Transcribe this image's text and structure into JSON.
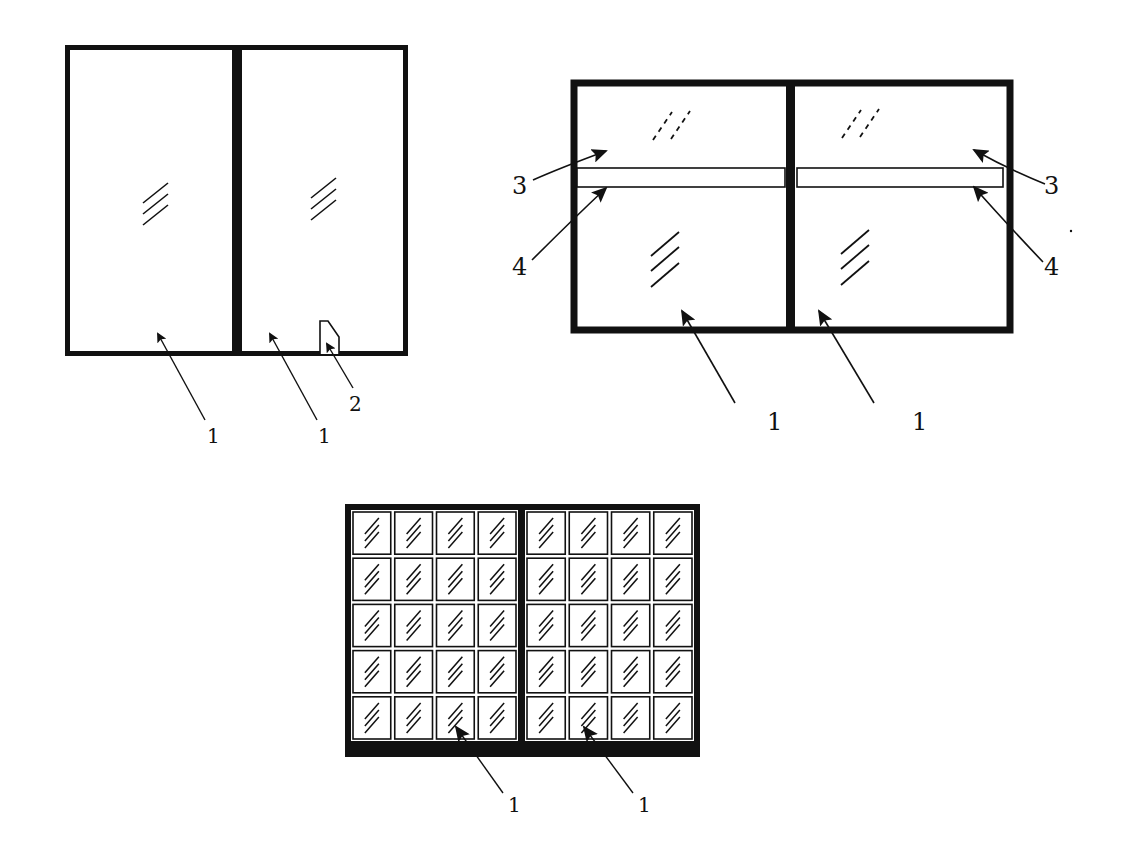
{
  "figures": [
    {
      "id": "figure-a",
      "description": "two-pane window with handle",
      "labels": [
        {
          "text": "1",
          "x": 212,
          "y": 443
        },
        {
          "text": "1",
          "x": 323,
          "y": 443
        },
        {
          "text": "2",
          "x": 355,
          "y": 411
        }
      ]
    },
    {
      "id": "figure-b",
      "description": "two-pane window with transom strips",
      "labels": [
        {
          "text": "3",
          "x": 521,
          "y": 194
        },
        {
          "text": "4",
          "x": 521,
          "y": 275
        },
        {
          "text": "3",
          "x": 1052,
          "y": 194
        },
        {
          "text": "4",
          "x": 1052,
          "y": 275
        },
        {
          "text": "1",
          "x": 775,
          "y": 430
        },
        {
          "text": "1",
          "x": 920,
          "y": 430
        }
      ]
    },
    {
      "id": "figure-c",
      "description": "two-section window with 8x5 grid of small panes",
      "grid": {
        "columns": 8,
        "rows": 5
      },
      "labels": [
        {
          "text": "1",
          "x": 515,
          "y": 812
        },
        {
          "text": "1",
          "x": 646,
          "y": 812
        }
      ]
    }
  ],
  "colors": {
    "ink": "#111111",
    "paper": "#ffffff"
  }
}
